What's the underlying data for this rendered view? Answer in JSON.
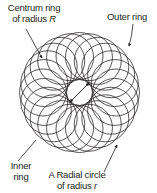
{
  "diagram": {
    "kind": "torus-of-circles",
    "stroke_color": "#231f20",
    "background_color": "#ffffff",
    "geometry": {
      "center_x": 79.5,
      "center_y": 92.5,
      "centrum_radius_R": 36.5,
      "radial_circle_radius_r": 23.5,
      "circle_count": 24,
      "inner_hole_radius": 13,
      "outer_radius": 60
    },
    "labels": {
      "centrum": {
        "line1": "Centrum ring",
        "line2_prefix": "of radius ",
        "line2_var": "R"
      },
      "outer": {
        "text": "Outer ring"
      },
      "inner": {
        "line1": "Inner",
        "line2": "ring"
      },
      "radial": {
        "line1": "A Radial circle",
        "line2_prefix": "of radius ",
        "line2_var": "r"
      }
    },
    "arrows": {
      "inner_radius_arrow": {
        "x1": 70,
        "y1": 102,
        "x2": 89,
        "y2": 83
      }
    }
  }
}
